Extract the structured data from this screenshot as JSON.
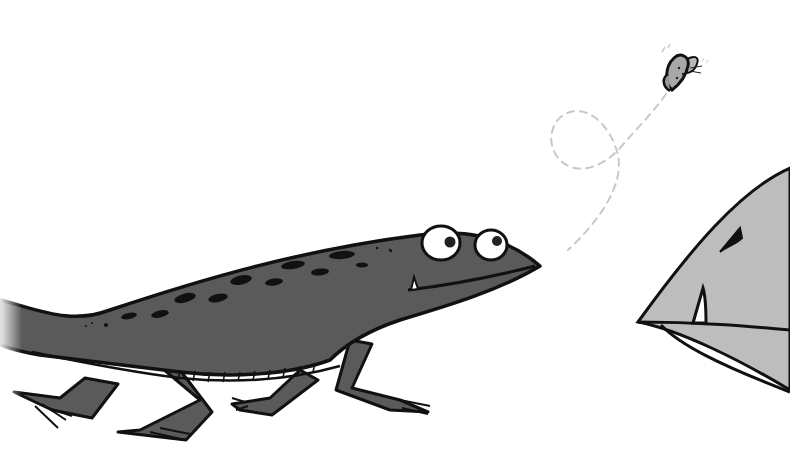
{
  "scene": {
    "description": "Cartoon illustration: a dark grey newt/salamander walking right toward a butterfly, while a large grey fish-like creature with a fang peeks in from the right edge",
    "background": "#ffffff",
    "colors": {
      "newt_body": "#5a5a5a",
      "newt_belly": "#6e6e6e",
      "outline": "#111111",
      "eye_white": "#ffffff",
      "pupil": "#222222",
      "creature_body": "#bdbdbd",
      "butterfly": "#a8a8a8",
      "flight_path": "#c8c8c8"
    },
    "elements": {
      "newt": "dark-grey-newt",
      "butterfly": "small-butterfly",
      "flight_path": "dashed-loop-flight-path",
      "creature": "grey-creature-head-with-fang"
    }
  }
}
